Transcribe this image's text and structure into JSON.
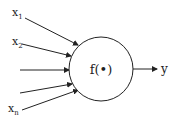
{
  "diagram": {
    "type": "neuron-model",
    "inputs": [
      {
        "label": "x",
        "sub": "1"
      },
      {
        "label": "x",
        "sub": "2"
      },
      {
        "label": "",
        "sub": ""
      },
      {
        "label": "",
        "sub": ""
      },
      {
        "label": "x",
        "sub": "n"
      }
    ],
    "node_label": "f(•)",
    "output_label": "y",
    "colors": {
      "stroke": "#222222",
      "background": "#ffffff"
    }
  }
}
